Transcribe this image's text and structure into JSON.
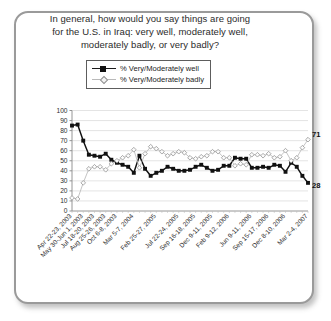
{
  "card": {
    "border_color": "#9a9a9a",
    "background": "#ffffff"
  },
  "title": {
    "line1": "In general, how would you say things are going",
    "line2": "for the U.S. in Iraq: very well, moderately well,",
    "line3": "moderately badly, or very badly?"
  },
  "legend": {
    "position": "top-center",
    "items": [
      {
        "label": "% Very/Moderately well",
        "marker": "filled-square",
        "color": "#111111"
      },
      {
        "label": "% Very/Moderately badly",
        "marker": "open-diamond",
        "color": "#b9b9b9"
      }
    ]
  },
  "end_labels": {
    "badly": "71",
    "well": "28"
  },
  "chart_data": {
    "type": "line",
    "title": "In general, how would you say things are going for the U.S. in Iraq: very well, moderately well, moderately badly, or very badly?",
    "xlabel": "",
    "ylabel": "",
    "ylim": [
      0,
      100
    ],
    "ytick_step": 10,
    "yticks": [
      0,
      10,
      20,
      30,
      40,
      50,
      60,
      70,
      80,
      90,
      100
    ],
    "grid": "horizontal",
    "legend_position": "top-center",
    "tick_labels": [
      "Apr 22-23, 2003",
      "May 30-Jun 1, 2003",
      "Jul 18-20, 2003",
      "Aug 25-26, 2003",
      "Oct 6-8, 2003",
      "Mar 5-7, 2004",
      "Feb 25-27, 2005",
      "Jul 22-24, 2005",
      "Sep 16-18, 2005",
      "Dec 9-11, 2005",
      "Feb 9-12, 2006",
      "Jun 9-11, 2006",
      "Sep 15-17, 2006",
      "Dec 8-10, 2006",
      "Mar 2-4, 2007"
    ],
    "tick_label_indices": [
      0,
      2,
      4,
      6,
      8,
      11,
      15,
      19,
      22,
      25,
      28,
      32,
      35,
      38,
      42
    ],
    "series": [
      {
        "name": "% Very/Moderately well",
        "marker": "filled-square",
        "color": "#111111",
        "values": [
          85,
          86,
          70,
          56,
          55,
          54,
          57,
          51,
          48,
          46,
          44,
          38,
          55,
          42,
          35,
          38,
          40,
          44,
          42,
          40,
          40,
          41,
          44,
          46,
          43,
          40,
          41,
          45,
          45,
          53,
          52,
          52,
          43,
          43,
          44,
          43,
          46,
          45,
          39,
          48,
          44,
          35,
          28
        ]
      },
      {
        "name": "% Very/Moderately badly",
        "marker": "open-diamond",
        "color": "#b9b9b9",
        "values": [
          13,
          12,
          28,
          42,
          44,
          44,
          41,
          47,
          50,
          53,
          55,
          61,
          43,
          57,
          64,
          62,
          59,
          55,
          57,
          59,
          58,
          53,
          52,
          54,
          55,
          59,
          59,
          53,
          53,
          45,
          47,
          46,
          56,
          56,
          55,
          57,
          53,
          54,
          60,
          50,
          53,
          63,
          71
        ]
      }
    ]
  }
}
